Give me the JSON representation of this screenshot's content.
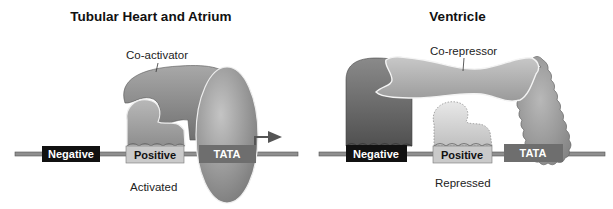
{
  "panels": [
    {
      "title": "Tubular Heart and Atrium",
      "cofactor_label": "Co-activator",
      "elements": [
        "Negative",
        "Positive",
        "TATA"
      ],
      "state_label": "Activated"
    },
    {
      "title": "Ventricle",
      "cofactor_label": "Co-repressor",
      "elements": [
        "Negative",
        "Positive",
        "TATA"
      ],
      "state_label": "Repressed"
    }
  ],
  "colors": {
    "dna_line": "#8a8a8a",
    "negative_box": "#111111",
    "positive_box": "#c9c9c9",
    "tata_box": "#6f6f6f",
    "protein_dark": "#6a6a6a",
    "protein_mid": "#9a9a9a",
    "protein_light": "#d2d2d2"
  }
}
